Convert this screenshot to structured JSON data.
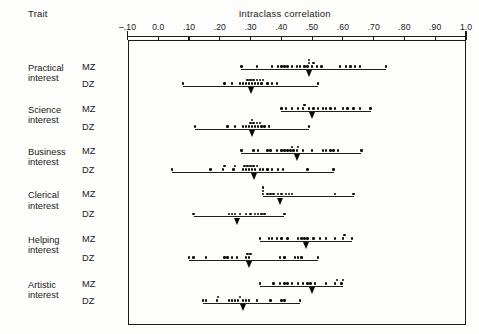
{
  "header": {
    "trait_column_label": "Trait",
    "axis_title": "Intraclass correlation"
  },
  "axis": {
    "ticks": [
      {
        "value": -0.1,
        "label": "–.10"
      },
      {
        "value": 0.0,
        "label": "0.0"
      },
      {
        "value": 0.1,
        "label": ".10"
      },
      {
        "value": 0.2,
        "label": ".20"
      },
      {
        "value": 0.3,
        "label": ".30"
      },
      {
        "value": 0.4,
        "label": ".40"
      },
      {
        "value": 0.5,
        "label": ".50"
      },
      {
        "value": 0.6,
        "label": ".60"
      },
      {
        "value": 0.7,
        "label": ".70"
      },
      {
        "value": 0.8,
        "label": ".80"
      },
      {
        "value": 0.9,
        "label": ".90"
      },
      {
        "value": 1.0,
        "label": "1.0"
      }
    ],
    "min": -0.1,
    "max": 1.0
  },
  "chart_data": {
    "type": "scatter",
    "title": "Intraclass correlation",
    "xlabel": "Intraclass correlation",
    "ylabel": "Trait",
    "xlim": [
      -0.1,
      1.0
    ],
    "grid": false,
    "legend": null,
    "group_label_key": "zygosity",
    "series": [
      {
        "trait": "Practical interest",
        "zygosity": "MZ",
        "range": [
          0.27,
          0.74
        ],
        "median": 0.49,
        "values": [
          0.27,
          0.32,
          0.37,
          0.39,
          0.4,
          0.41,
          0.42,
          0.435,
          0.45,
          0.46,
          0.475,
          0.485,
          0.49,
          0.49,
          0.5,
          0.505,
          0.515,
          0.53,
          0.59,
          0.61,
          0.625,
          0.64,
          0.655,
          0.74
        ]
      },
      {
        "trait": "Practical interest",
        "zygosity": "DZ",
        "range": [
          0.08,
          0.52
        ],
        "median": 0.3,
        "values": [
          0.08,
          0.215,
          0.24,
          0.265,
          0.275,
          0.285,
          0.29,
          0.295,
          0.3,
          0.305,
          0.31,
          0.315,
          0.32,
          0.325,
          0.33,
          0.335,
          0.34,
          0.355,
          0.37,
          0.385,
          0.52
        ]
      },
      {
        "trait": "Science interest",
        "zygosity": "MZ",
        "range": [
          0.4,
          0.69
        ],
        "median": 0.5,
        "values": [
          0.4,
          0.415,
          0.435,
          0.455,
          0.47,
          0.475,
          0.49,
          0.505,
          0.52,
          0.535,
          0.545,
          0.56,
          0.575,
          0.6,
          0.615,
          0.635,
          0.655,
          0.69
        ]
      },
      {
        "trait": "Science interest",
        "zygosity": "DZ",
        "range": [
          0.12,
          0.49
        ],
        "median": 0.305,
        "values": [
          0.12,
          0.225,
          0.25,
          0.275,
          0.285,
          0.295,
          0.3,
          0.305,
          0.305,
          0.31,
          0.315,
          0.32,
          0.325,
          0.33,
          0.335,
          0.345,
          0.36,
          0.49
        ]
      },
      {
        "trait": "Business interest",
        "zygosity": "MZ",
        "range": [
          0.27,
          0.66
        ],
        "median": 0.45,
        "values": [
          0.27,
          0.31,
          0.325,
          0.355,
          0.365,
          0.385,
          0.4,
          0.41,
          0.42,
          0.43,
          0.435,
          0.44,
          0.45,
          0.455,
          0.47,
          0.5,
          0.535,
          0.545,
          0.56,
          0.57,
          0.585,
          0.66
        ]
      },
      {
        "trait": "Business interest",
        "zygosity": "DZ",
        "range": [
          0.045,
          0.57
        ],
        "median": 0.31,
        "values": [
          0.045,
          0.17,
          0.21,
          0.215,
          0.245,
          0.25,
          0.275,
          0.28,
          0.285,
          0.29,
          0.295,
          0.3,
          0.305,
          0.31,
          0.315,
          0.32,
          0.33,
          0.34,
          0.355,
          0.37,
          0.39,
          0.405,
          0.485,
          0.57
        ]
      },
      {
        "trait": "Clerical interest",
        "zygosity": "MZ",
        "range": [
          0.34,
          0.635
        ],
        "median": 0.395,
        "values": [
          0.34,
          0.34,
          0.34,
          0.355,
          0.365,
          0.375,
          0.39,
          0.4,
          0.415,
          0.425,
          0.435,
          0.575,
          0.635
        ]
      },
      {
        "trait": "Clerical interest",
        "zygosity": "DZ",
        "range": [
          0.115,
          0.41
        ],
        "median": 0.255,
        "values": [
          0.115,
          0.23,
          0.24,
          0.25,
          0.265,
          0.285,
          0.3,
          0.315,
          0.325,
          0.335,
          0.345,
          0.41
        ]
      },
      {
        "trait": "Helping interest",
        "zygosity": "MZ",
        "range": [
          0.33,
          0.63
        ],
        "median": 0.48,
        "values": [
          0.33,
          0.36,
          0.37,
          0.385,
          0.4,
          0.42,
          0.455,
          0.465,
          0.475,
          0.485,
          0.505,
          0.525,
          0.545,
          0.575,
          0.6,
          0.605,
          0.63
        ]
      },
      {
        "trait": "Helping interest",
        "zygosity": "DZ",
        "range": [
          0.1,
          0.52
        ],
        "median": 0.295,
        "values": [
          0.1,
          0.115,
          0.155,
          0.215,
          0.225,
          0.24,
          0.255,
          0.285,
          0.29,
          0.295,
          0.3,
          0.395,
          0.41,
          0.445,
          0.455,
          0.465,
          0.52
        ]
      },
      {
        "trait": "Artistic interest",
        "zygosity": "MZ",
        "range": [
          0.33,
          0.6
        ],
        "median": 0.5,
        "values": [
          0.33,
          0.375,
          0.395,
          0.41,
          0.42,
          0.435,
          0.455,
          0.47,
          0.485,
          0.495,
          0.51,
          0.545,
          0.575,
          0.58,
          0.595,
          0.6
        ]
      },
      {
        "trait": "Artistic interest",
        "zygosity": "DZ",
        "range": [
          0.145,
          0.46
        ],
        "median": 0.275,
        "values": [
          0.145,
          0.155,
          0.19,
          0.195,
          0.23,
          0.24,
          0.25,
          0.26,
          0.265,
          0.275,
          0.285,
          0.295,
          0.32,
          0.365,
          0.4,
          0.41,
          0.46
        ]
      }
    ]
  },
  "rows": [
    {
      "trait_line1": "Practical",
      "trait_line2": "interest",
      "mz": "MZ",
      "dz": "DZ"
    },
    {
      "trait_line1": "Science",
      "trait_line2": "interest",
      "mz": "MZ",
      "dz": "DZ"
    },
    {
      "trait_line1": "Business",
      "trait_line2": "interest",
      "mz": "MZ",
      "dz": "DZ"
    },
    {
      "trait_line1": "Clerical",
      "trait_line2": "interest",
      "mz": "MZ",
      "dz": "DZ"
    },
    {
      "trait_line1": "Helping",
      "trait_line2": "interest",
      "mz": "MZ",
      "dz": "DZ"
    },
    {
      "trait_line1": "Artistic",
      "trait_line2": "interest",
      "mz": "MZ",
      "dz": "DZ"
    }
  ]
}
